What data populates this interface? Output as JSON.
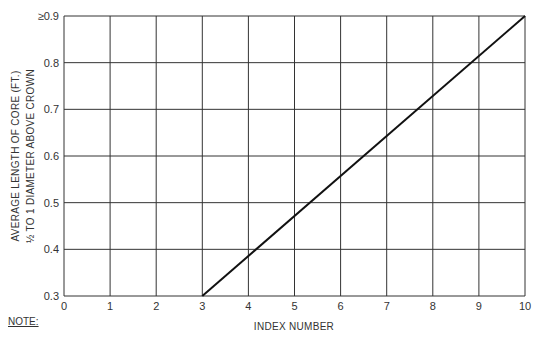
{
  "chart_data": {
    "type": "line",
    "title": "",
    "xlabel": "INDEX NUMBER",
    "ylabel_line1": "AVERAGE LENGTH OF CORE (FT.)",
    "ylabel_line2": "½ TO 1 DIAMETER ABOVE CROWN",
    "xlim": [
      0,
      10
    ],
    "ylim": [
      0.3,
      0.9
    ],
    "x_ticks": [
      "0",
      "1",
      "2",
      "3",
      "4",
      "5",
      "6",
      "7",
      "8",
      "9",
      "10"
    ],
    "y_ticks": [
      "0.3",
      "0.4",
      "0.5",
      "0.6",
      "0.7",
      "0.8",
      "≥0.9"
    ],
    "grid": true,
    "legend": null,
    "series": [
      {
        "name": "core length",
        "x": [
          3,
          10
        ],
        "y": [
          0.3,
          0.9
        ]
      }
    ]
  },
  "note_label": "NOTE:"
}
